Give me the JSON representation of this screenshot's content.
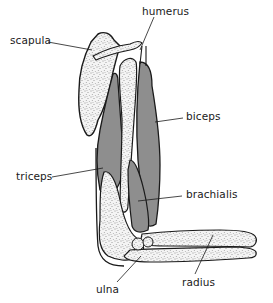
{
  "diagram": {
    "colors": {
      "muscle": "#8e8e8e",
      "bone": "#f2f2f2",
      "outline": "#1a1a1a",
      "stipple": "#2a2a2a",
      "background": "#ffffff"
    },
    "labels": {
      "humerus": "humerus",
      "scapula": "scapula",
      "biceps": "biceps",
      "triceps": "triceps",
      "brachialis": "brachialis",
      "ulna": "ulna",
      "radius": "radius"
    }
  }
}
